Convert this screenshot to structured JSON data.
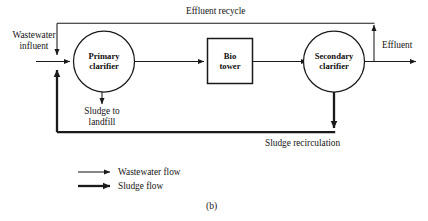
{
  "figure": {
    "caption": "(b)",
    "type": "process-flow-diagram"
  },
  "nodes": [
    {
      "id": "primary-clarifier",
      "label_line1": "Primary",
      "label_line2": "clarifier",
      "shape": "circle"
    },
    {
      "id": "bio-tower",
      "label_line1": "Bio",
      "label_line2": "tower",
      "shape": "rectangle"
    },
    {
      "id": "secondary-clarifier",
      "label_line1": "Secondary",
      "label_line2": "clarifier",
      "shape": "circle"
    }
  ],
  "labels": {
    "influent_line1": "Wastewater",
    "influent_line2": "influent",
    "effluent_recycle": "Effluent recycle",
    "effluent": "Effluent",
    "sludge_to_landfill_line1": "Sludge to",
    "sludge_to_landfill_line2": "landfill",
    "sludge_recirculation": "Sludge recirculation"
  },
  "legend": {
    "items": [
      {
        "id": "wastewater-flow",
        "label": "Wastewater flow",
        "stroke": "thin"
      },
      {
        "id": "sludge-flow",
        "label": "Sludge flow",
        "stroke": "thick"
      }
    ]
  },
  "colors": {
    "line": "#1a1a1a",
    "text": "#151515",
    "background": "#ffffff"
  }
}
